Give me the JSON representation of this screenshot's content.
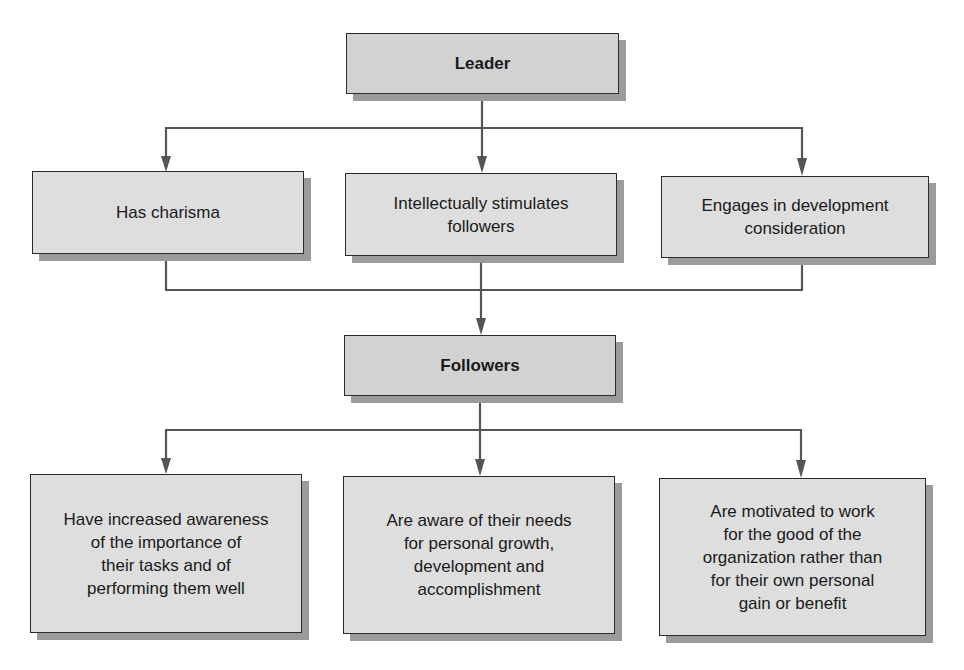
{
  "diagram": {
    "type": "hierarchical-flow",
    "colors": {
      "line": "#555555",
      "box_fill": "#dedede",
      "head_fill": "#d2d2d2",
      "shadow": "#9b9b9b",
      "border": "#2b2b2b"
    },
    "leader": {
      "label": "Leader"
    },
    "leader_traits": [
      {
        "label": "Has charisma"
      },
      {
        "label": "Intellectually stimulates\nfollowers"
      },
      {
        "label": "Engages in development\nconsideration"
      }
    ],
    "followers": {
      "label": "Followers"
    },
    "follower_outcomes": [
      {
        "label": "Have increased awareness\nof the importance of\ntheir tasks and of\nperforming them well"
      },
      {
        "label": "Are aware of their needs\nfor personal growth,\ndevelopment and\naccomplishment"
      },
      {
        "label": "Are motivated to work\nfor the good of the\norganization rather than\nfor their own personal\ngain or benefit"
      }
    ]
  }
}
